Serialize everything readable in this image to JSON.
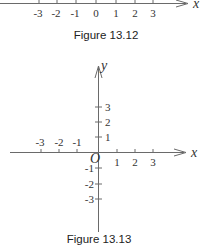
{
  "figure_13_12": {
    "caption": "Figure 13.12",
    "axis_label": "x",
    "ticks": [
      "-3",
      "-2",
      "-1",
      "0",
      "1",
      "2",
      "3"
    ]
  },
  "figure_13_13": {
    "caption": "Figure 13.13",
    "x_axis_label": "x",
    "y_axis_label": "y",
    "origin_label": "O",
    "x_ticks_negative": [
      "-3",
      "-2",
      "-1"
    ],
    "x_ticks_positive": [
      "1",
      "2",
      "3"
    ],
    "y_ticks_positive": [
      "1",
      "2",
      "3"
    ],
    "y_ticks_negative": [
      "-1",
      "-2",
      "-3"
    ]
  },
  "colors": {
    "axis": "#6a6a6a",
    "text": "#333333"
  }
}
